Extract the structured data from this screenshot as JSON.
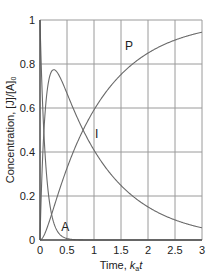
{
  "chart_data": {
    "type": "line",
    "title": "",
    "xlabel": "Time, k_a t",
    "ylabel": "Concentration, [J]/[A]_0",
    "xlim": [
      0,
      3
    ],
    "ylim": [
      0,
      1
    ],
    "x_ticks": [
      "0",
      "0.5",
      "1",
      "1.5",
      "2",
      "2.5",
      "3"
    ],
    "y_ticks": [
      "0",
      "0.2",
      "0.4",
      "0.6",
      "0.8",
      "1"
    ],
    "grid": true,
    "legend": "inline curve labels",
    "x": [
      0,
      0.05,
      0.1,
      0.15,
      0.2,
      0.25,
      0.3,
      0.4,
      0.5,
      0.6,
      0.7,
      0.8,
      1.0,
      1.25,
      1.5,
      1.75,
      2.0,
      2.25,
      2.5,
      2.75,
      3.0
    ],
    "series": [
      {
        "name": "A",
        "values": [
          1.0,
          0.61,
          0.37,
          0.22,
          0.14,
          0.08,
          0.05,
          0.02,
          0.01,
          0.0,
          0.0,
          0.0,
          0.0,
          0.0,
          0.0,
          0.0,
          0.0,
          0.0,
          0.0,
          0.0,
          0.0
        ]
      },
      {
        "name": "I",
        "values": [
          0.0,
          0.38,
          0.59,
          0.71,
          0.76,
          0.77,
          0.77,
          0.72,
          0.67,
          0.61,
          0.55,
          0.5,
          0.41,
          0.32,
          0.25,
          0.19,
          0.15,
          0.12,
          0.09,
          0.07,
          0.06
        ]
      },
      {
        "name": "P",
        "values": [
          0.0,
          0.01,
          0.04,
          0.07,
          0.11,
          0.15,
          0.18,
          0.26,
          0.33,
          0.39,
          0.45,
          0.5,
          0.59,
          0.68,
          0.75,
          0.81,
          0.85,
          0.88,
          0.91,
          0.93,
          0.94
        ]
      }
    ],
    "curve_labels": [
      {
        "text": "A",
        "x": 0.47,
        "y": 0.06
      },
      {
        "text": "I",
        "x": 1.05,
        "y": 0.48
      },
      {
        "text": "P",
        "x": 1.65,
        "y": 0.88
      }
    ]
  },
  "labels": {
    "xlabel_prefix": "Time, ",
    "xlabel_k": "k",
    "xlabel_sub": "a",
    "xlabel_t": "t",
    "ylabel_main": "Concentration, [J]/[A]",
    "ylabel_sub": "0"
  },
  "style": {
    "grid_color": "#9a9a9a",
    "axis_color": "#555555",
    "curve_color": "#6a6a6a"
  }
}
